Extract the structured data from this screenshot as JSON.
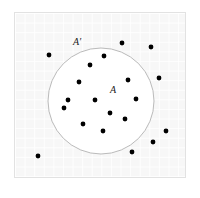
{
  "figure": {
    "type": "set-venn-scatter",
    "frame": {
      "x": 14,
      "y": 12,
      "width": 172,
      "height": 166,
      "background_color": "#f7f7f7",
      "border_color": "#e2e2e2",
      "grid": true,
      "grid_spacing": 9.6,
      "grid_color": "#ffffff"
    },
    "circle": {
      "name": "set-A",
      "cx": 101,
      "cy": 101,
      "r": 53,
      "fill": "#ffffff",
      "stroke": "#a8a8a8",
      "stroke_width": 0.8
    },
    "labels": [
      {
        "name": "set-complement-label",
        "text": "A′",
        "x": 73,
        "y": 37,
        "italic": true
      },
      {
        "name": "set-label",
        "text": "A",
        "x": 110,
        "y": 85,
        "italic": true
      }
    ],
    "dot": {
      "radius": 2.4,
      "color": "#000000"
    },
    "points_inside_A": [
      {
        "x": 90,
        "y": 65
      },
      {
        "x": 104,
        "y": 56
      },
      {
        "x": 79,
        "y": 82
      },
      {
        "x": 128,
        "y": 80
      },
      {
        "x": 68,
        "y": 100
      },
      {
        "x": 95,
        "y": 100
      },
      {
        "x": 136,
        "y": 99
      },
      {
        "x": 64,
        "y": 108
      },
      {
        "x": 110,
        "y": 113
      },
      {
        "x": 125,
        "y": 119
      },
      {
        "x": 83,
        "y": 124
      },
      {
        "x": 103,
        "y": 131
      }
    ],
    "points_outside_A": [
      {
        "x": 122,
        "y": 43
      },
      {
        "x": 151,
        "y": 47
      },
      {
        "x": 49,
        "y": 55
      },
      {
        "x": 159,
        "y": 78
      },
      {
        "x": 166,
        "y": 131
      },
      {
        "x": 153,
        "y": 142
      },
      {
        "x": 132,
        "y": 152
      },
      {
        "x": 38,
        "y": 156
      }
    ],
    "counts": {
      "inside_label": "12",
      "outside_label": "8",
      "total_label": "20"
    }
  }
}
